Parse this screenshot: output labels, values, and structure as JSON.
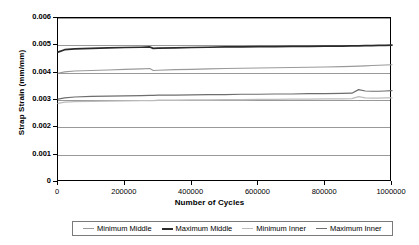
{
  "chart_data": {
    "type": "line",
    "title": "",
    "xlabel": "Number of Cycles",
    "ylabel": "Strap Strain (mm/mm)",
    "xlim": [
      0,
      1000000
    ],
    "ylim": [
      0,
      0.006
    ],
    "xticks": [
      0,
      200000,
      400000,
      600000,
      800000,
      1000000
    ],
    "xtick_labels": [
      "0",
      "200000",
      "400000",
      "600000",
      "800000",
      "1000000"
    ],
    "yticks": [
      0,
      0.001,
      0.002,
      0.003,
      0.004,
      0.005,
      0.006
    ],
    "ytick_labels": [
      "0",
      "0.001",
      "0.002",
      "0.003",
      "0.004",
      "0.005",
      "0.006"
    ],
    "grid": "horizontal",
    "legend_position": "bottom",
    "x": [
      0,
      20000,
      50000,
      100000,
      150000,
      200000,
      250000,
      275000,
      285000,
      300000,
      350000,
      400000,
      450000,
      500000,
      550000,
      600000,
      650000,
      700000,
      750000,
      800000,
      850000,
      880000,
      900000,
      920000,
      940000,
      960000,
      980000,
      1000000
    ],
    "series": [
      {
        "name": "Minimum Middle",
        "color": "#9a9a9a",
        "width": 1.1,
        "values": [
          0.00398,
          0.00403,
          0.00406,
          0.00408,
          0.0041,
          0.00412,
          0.00414,
          0.00415,
          0.00408,
          0.00409,
          0.00411,
          0.00412,
          0.00414,
          0.00415,
          0.00416,
          0.00417,
          0.00418,
          0.00419,
          0.0042,
          0.00421,
          0.00422,
          0.00423,
          0.00424,
          0.00425,
          0.00426,
          0.00427,
          0.00428,
          0.00429
        ]
      },
      {
        "name": "Maximum Middle",
        "color": "#2b2b2b",
        "width": 1.7,
        "values": [
          0.00475,
          0.00484,
          0.00487,
          0.00489,
          0.00491,
          0.00492,
          0.00493,
          0.00494,
          0.00489,
          0.0049,
          0.00491,
          0.00492,
          0.00493,
          0.00494,
          0.00494,
          0.00495,
          0.00495,
          0.00496,
          0.00496,
          0.00497,
          0.00497,
          0.00498,
          0.00498,
          0.00499,
          0.00499,
          0.005,
          0.005,
          0.00501
        ]
      },
      {
        "name": "Minimum Inner",
        "color": "#bcbcbc",
        "width": 1.3,
        "values": [
          0.00288,
          0.00292,
          0.00294,
          0.00295,
          0.00296,
          0.00297,
          0.00298,
          0.00298,
          0.00298,
          0.00299,
          0.00299,
          0.003,
          0.003,
          0.00301,
          0.00301,
          0.00302,
          0.00302,
          0.00303,
          0.00303,
          0.00304,
          0.00304,
          0.00305,
          0.00312,
          0.00308,
          0.00307,
          0.00307,
          0.00308,
          0.00308
        ]
      },
      {
        "name": "Maximum Inner",
        "color": "#6e6e6e",
        "width": 1.2,
        "values": [
          0.00303,
          0.00308,
          0.00311,
          0.00313,
          0.00314,
          0.00315,
          0.00316,
          0.00317,
          0.00317,
          0.00318,
          0.00318,
          0.00319,
          0.0032,
          0.0032,
          0.00321,
          0.00321,
          0.00322,
          0.00322,
          0.00323,
          0.00323,
          0.00324,
          0.00325,
          0.00338,
          0.00333,
          0.00332,
          0.00332,
          0.00333,
          0.00334
        ]
      }
    ]
  }
}
